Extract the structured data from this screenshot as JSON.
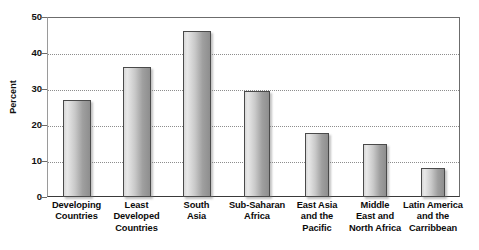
{
  "chart_data": {
    "type": "bar",
    "title": "",
    "xlabel": "",
    "ylabel": "Percent",
    "ylim": [
      0,
      50
    ],
    "ytick_step": 10,
    "grid": "horizontal-dotted",
    "legend": "none",
    "categories": [
      "Developing Countries",
      "Least Developed Countries",
      "South Asia",
      "Sub-Saharan Africa",
      "East Asia and the Pacific",
      "Middle East and North Africa",
      "Latin America and the Carribbean"
    ],
    "category_lines": [
      [
        "Developing",
        "Countries"
      ],
      [
        "Least",
        "Developed",
        "Countries"
      ],
      [
        "South",
        "Asia"
      ],
      [
        "Sub-Saharan",
        "Africa"
      ],
      [
        "East Asia",
        "and the",
        "Pacific"
      ],
      [
        "Middle",
        "East and",
        "North Africa"
      ],
      [
        "Latin America",
        "and the",
        "Carribbean"
      ]
    ],
    "values": [
      27,
      36.2,
      46.2,
      29.5,
      17.8,
      14.6,
      8.1
    ],
    "ytick_labels": [
      "50",
      "40",
      "30",
      "20",
      "10",
      "0"
    ],
    "ytick_values": [
      50,
      40,
      30,
      20,
      10,
      0
    ],
    "bar_fill_light": "#e8e8e8",
    "bar_fill_dark": "#8e8e8e",
    "bar_border": "#4a4a4a",
    "gridline_color": "#8d8d8d",
    "axis_color": "#6b6b6b",
    "background": "#ffffff"
  }
}
